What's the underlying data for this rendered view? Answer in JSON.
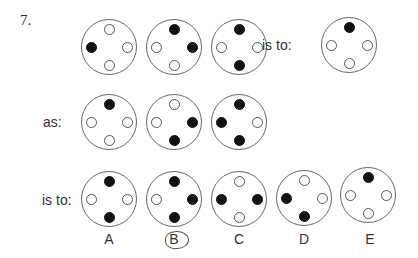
{
  "question": {
    "number": "7.",
    "connector_is_to": "is to:",
    "connector_as": "as:",
    "connector_is_to_2": "is to:"
  },
  "legend": {
    "filled_color": "#111111",
    "empty_color": "#ffffff",
    "outline_color": "#666666"
  },
  "row1": {
    "figures": [
      {
        "top": "empty",
        "right": "empty",
        "bottom": "empty",
        "left": "filled"
      },
      {
        "top": "filled",
        "right": "filled",
        "bottom": "empty",
        "left": "empty"
      },
      {
        "top": "filled",
        "right": "empty",
        "bottom": "filled",
        "left": "empty"
      }
    ],
    "result": {
      "top": "filled",
      "right": "empty",
      "bottom": "empty",
      "left": "empty"
    }
  },
  "row2": {
    "figures": [
      {
        "top": "filled",
        "right": "empty",
        "bottom": "empty",
        "left": "empty"
      },
      {
        "top": "empty",
        "right": "filled",
        "bottom": "filled",
        "left": "empty"
      },
      {
        "top": "filled",
        "right": "empty",
        "bottom": "filled",
        "left": "filled"
      }
    ]
  },
  "options": [
    {
      "label": "A",
      "top": "filled",
      "right": "empty",
      "bottom": "filled",
      "left": "empty"
    },
    {
      "label": "B",
      "top": "filled",
      "right": "filled",
      "bottom": "filled",
      "left": "empty",
      "circled": true
    },
    {
      "label": "C",
      "top": "empty",
      "right": "filled",
      "bottom": "empty",
      "left": "filled"
    },
    {
      "label": "D",
      "top": "empty",
      "right": "empty",
      "bottom": "filled",
      "left": "filled"
    },
    {
      "label": "E",
      "top": "filled",
      "right": "empty",
      "bottom": "empty",
      "left": "empty"
    }
  ]
}
